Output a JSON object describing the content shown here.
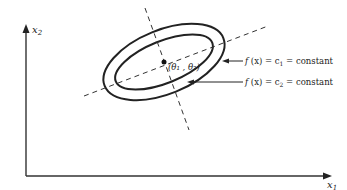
{
  "diagram": {
    "axes": {
      "x_label": "x",
      "x_sub": "1",
      "y_label": "x",
      "y_sub": "2"
    },
    "center_label": "(θ₁ , θ₂)",
    "contours": [
      {
        "label_f": "f",
        "label_rest": " (x) = c",
        "sub": "1",
        "tail": " = constant"
      },
      {
        "label_f": "f",
        "label_rest": " (x) = c",
        "sub": "2",
        "tail": " = constant"
      }
    ],
    "colors": {
      "ink": "#222222",
      "background": "#ffffff"
    }
  }
}
